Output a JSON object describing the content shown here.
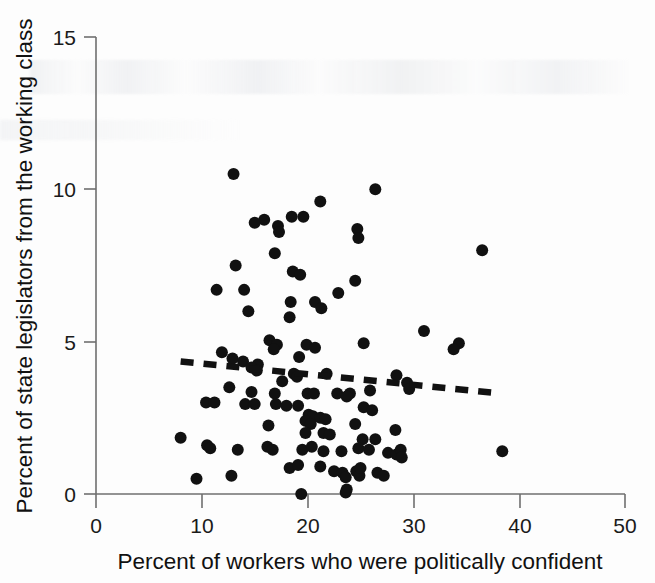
{
  "figure": {
    "background_color": "#fdfdfd",
    "ink_color": "#111111",
    "axis_color": "#6f6f6f"
  },
  "labels": {
    "x_axis_title": "Percent of workers who were politically confident",
    "y_axis_title": "Percent of state legislators from the working class",
    "x_ticks": [
      "0",
      "10",
      "20",
      "30",
      "40",
      "50"
    ],
    "y_ticks": [
      "0",
      "5",
      "10",
      "15"
    ]
  },
  "chart_data": {
    "type": "scatter",
    "title": "",
    "xlabel": "Percent of workers who were politically confident",
    "ylabel": "Percent of state legislators from the working class",
    "xlim": [
      0,
      50
    ],
    "ylim": [
      0,
      15
    ],
    "xticks": [
      0,
      10,
      20,
      30,
      40,
      50
    ],
    "yticks": [
      0,
      5,
      10,
      15
    ],
    "grid": false,
    "legend": "none",
    "marker": {
      "shape": "circle",
      "color": "#111111",
      "size_px": 11
    },
    "series": [
      {
        "name": "U.S. states",
        "points": [
          [
            13.0,
            10.5
          ],
          [
            26.4,
            10.0
          ],
          [
            21.2,
            9.6
          ],
          [
            18.5,
            9.1
          ],
          [
            19.6,
            9.1
          ],
          [
            15.9,
            9.0
          ],
          [
            15.0,
            8.9
          ],
          [
            17.2,
            8.8
          ],
          [
            17.3,
            8.6
          ],
          [
            24.7,
            8.7
          ],
          [
            24.8,
            8.4
          ],
          [
            36.5,
            8.0
          ],
          [
            16.9,
            7.9
          ],
          [
            13.2,
            7.5
          ],
          [
            18.6,
            7.3
          ],
          [
            19.3,
            7.2
          ],
          [
            24.5,
            7.0
          ],
          [
            11.4,
            6.7
          ],
          [
            14.0,
            6.7
          ],
          [
            22.9,
            6.6
          ],
          [
            18.4,
            6.3
          ],
          [
            20.7,
            6.3
          ],
          [
            21.3,
            6.1
          ],
          [
            14.4,
            6.0
          ],
          [
            18.3,
            5.8
          ],
          [
            31.0,
            5.35
          ],
          [
            34.3,
            4.95
          ],
          [
            33.8,
            4.75
          ],
          [
            25.3,
            4.95
          ],
          [
            16.4,
            5.05
          ],
          [
            17.1,
            4.9
          ],
          [
            19.9,
            4.9
          ],
          [
            20.7,
            4.8
          ],
          [
            16.8,
            4.75
          ],
          [
            11.9,
            4.65
          ],
          [
            19.2,
            4.5
          ],
          [
            12.9,
            4.45
          ],
          [
            13.9,
            4.35
          ],
          [
            15.3,
            4.25
          ],
          [
            14.7,
            4.15
          ],
          [
            15.2,
            4.05
          ],
          [
            18.7,
            3.95
          ],
          [
            19.0,
            3.85
          ],
          [
            21.8,
            3.95
          ],
          [
            28.4,
            3.9
          ],
          [
            29.4,
            3.65
          ],
          [
            17.6,
            3.7
          ],
          [
            29.6,
            3.45
          ],
          [
            22.8,
            3.3
          ],
          [
            24.0,
            3.3
          ],
          [
            25.9,
            3.4
          ],
          [
            12.6,
            3.5
          ],
          [
            14.7,
            3.35
          ],
          [
            16.9,
            3.3
          ],
          [
            20.0,
            3.3
          ],
          [
            20.6,
            3.3
          ],
          [
            23.7,
            3.2
          ],
          [
            10.4,
            3.0
          ],
          [
            11.2,
            3.0
          ],
          [
            14.1,
            2.95
          ],
          [
            15.0,
            2.95
          ],
          [
            17.0,
            2.95
          ],
          [
            18.0,
            2.9
          ],
          [
            19.1,
            2.9
          ],
          [
            25.3,
            2.85
          ],
          [
            26.1,
            2.75
          ],
          [
            20.1,
            2.6
          ],
          [
            20.5,
            2.55
          ],
          [
            21.2,
            2.5
          ],
          [
            21.7,
            2.45
          ],
          [
            19.8,
            2.4
          ],
          [
            20.3,
            2.3
          ],
          [
            16.3,
            2.25
          ],
          [
            24.5,
            2.3
          ],
          [
            28.3,
            2.1
          ],
          [
            19.8,
            2.0
          ],
          [
            21.5,
            2.0
          ],
          [
            22.1,
            1.95
          ],
          [
            25.2,
            1.8
          ],
          [
            26.4,
            1.8
          ],
          [
            8.0,
            1.85
          ],
          [
            10.5,
            1.6
          ],
          [
            10.8,
            1.5
          ],
          [
            13.4,
            1.45
          ],
          [
            16.2,
            1.55
          ],
          [
            16.7,
            1.45
          ],
          [
            19.5,
            1.45
          ],
          [
            20.4,
            1.55
          ],
          [
            21.5,
            1.4
          ],
          [
            23.2,
            1.4
          ],
          [
            24.8,
            1.5
          ],
          [
            25.8,
            1.45
          ],
          [
            27.6,
            1.35
          ],
          [
            28.4,
            1.3
          ],
          [
            28.8,
            1.45
          ],
          [
            28.9,
            1.2
          ],
          [
            38.4,
            1.4
          ],
          [
            18.3,
            0.85
          ],
          [
            19.1,
            0.95
          ],
          [
            21.2,
            0.9
          ],
          [
            22.5,
            0.75
          ],
          [
            23.3,
            0.7
          ],
          [
            23.6,
            0.55
          ],
          [
            24.6,
            0.75
          ],
          [
            24.9,
            0.6
          ],
          [
            25.0,
            0.85
          ],
          [
            26.6,
            0.7
          ],
          [
            27.2,
            0.6
          ],
          [
            9.5,
            0.5
          ],
          [
            12.8,
            0.6
          ],
          [
            19.4,
            0.0
          ],
          [
            23.6,
            0.05
          ],
          [
            23.7,
            0.15
          ]
        ]
      }
    ],
    "trendline": {
      "style": "dashed",
      "color": "#111111",
      "x_start": 8.0,
      "y_start": 4.35,
      "x_end": 38.2,
      "y_end": 3.3,
      "description": "slightly negative, nearly flat fitted line"
    }
  }
}
